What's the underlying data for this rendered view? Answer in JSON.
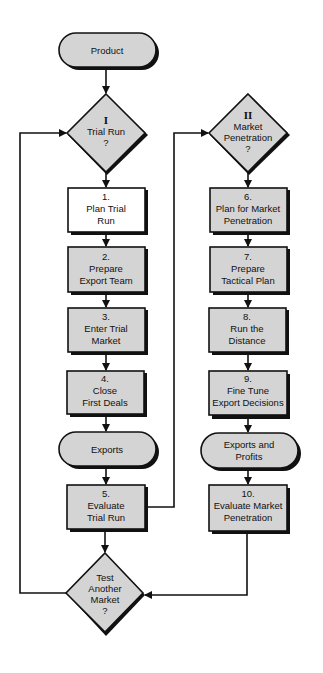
{
  "diagram": {
    "colors": {
      "fill": "#d4d4d4",
      "white_fill": "#ffffff",
      "stroke": "#111111",
      "background": "#ffffff"
    },
    "start": {
      "label": "Product"
    },
    "decision_1": {
      "roman": "I",
      "line1": "Trial Run",
      "line2": "?"
    },
    "decision_2": {
      "roman": "II",
      "line1": "Market",
      "line2": "Penetration",
      "line3": "?"
    },
    "decision_3": {
      "line1": "Test",
      "line2": "Another",
      "line3": "Market",
      "line4": "?"
    },
    "left_steps": [
      {
        "num": "1.",
        "line1": "Plan Trial",
        "line2": "Run"
      },
      {
        "num": "2.",
        "line1": "Prepare",
        "line2": "Export Team"
      },
      {
        "num": "3.",
        "line1": "Enter Trial",
        "line2": "Market"
      },
      {
        "num": "4.",
        "line1": "Close",
        "line2": "First Deals"
      },
      {
        "num": "5.",
        "line1": "Evaluate",
        "line2": "Trial Run"
      }
    ],
    "right_steps": [
      {
        "num": "6.",
        "line1": "Plan for Market",
        "line2": "Penetration"
      },
      {
        "num": "7.",
        "line1": "Prepare",
        "line2": "Tactical Plan"
      },
      {
        "num": "8.",
        "line1": "Run the",
        "line2": "Distance"
      },
      {
        "num": "9.",
        "line1": "Fine Tune",
        "line2": "Export Decisions"
      },
      {
        "num": "10.",
        "line1": "Evaluate Market",
        "line2": "Penetration"
      }
    ],
    "terminal_left": {
      "label": "Exports"
    },
    "terminal_right": {
      "line1": "Exports and",
      "line2": "Profits"
    }
  }
}
